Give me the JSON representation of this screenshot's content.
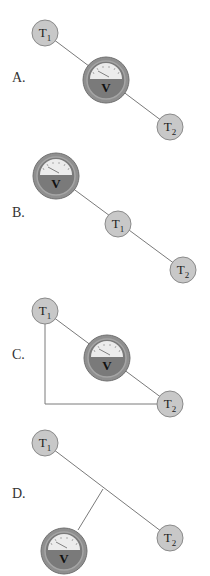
{
  "options": [
    {
      "label": "A.",
      "t1": "T",
      "t1_sub": "1",
      "t2": "T",
      "t2_sub": "2",
      "meter": "V"
    },
    {
      "label": "B.",
      "t1": "T",
      "t1_sub": "1",
      "t2": "T",
      "t2_sub": "2",
      "meter": "V"
    },
    {
      "label": "C.",
      "t1": "T",
      "t1_sub": "1",
      "t2": "T",
      "t2_sub": "2",
      "meter": "V"
    },
    {
      "label": "D.",
      "t1": "T",
      "t1_sub": "1",
      "t2": "T",
      "t2_sub": "2",
      "meter": "V"
    }
  ],
  "colors": {
    "terminal_fill": "#c8c8c8",
    "terminal_stroke": "#8a8a8a",
    "meter_body": "#7a7a7a",
    "meter_ring": "#9a9a9a",
    "meter_dial": "#ececec",
    "wire": "#7a7a7a"
  }
}
